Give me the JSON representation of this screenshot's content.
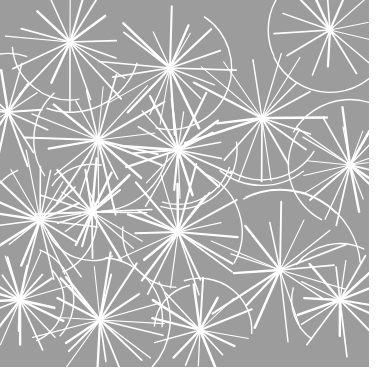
{
  "image": {
    "description": "Gray textile pattern with white hand-drawn starburst / dandelion line motifs",
    "background_color": "#9c9c9c",
    "line_color": "#ffffff",
    "border_color": "#ffffff"
  },
  "bursts": [
    {
      "x": 70,
      "y": 42,
      "r": 70
    },
    {
      "x": 170,
      "y": 68,
      "r": 65
    },
    {
      "x": 8,
      "y": 112,
      "r": 55
    },
    {
      "x": 98,
      "y": 140,
      "r": 70
    },
    {
      "x": 178,
      "y": 150,
      "r": 60
    },
    {
      "x": 262,
      "y": 118,
      "r": 75
    },
    {
      "x": 330,
      "y": 30,
      "r": 60
    },
    {
      "x": 350,
      "y": 165,
      "r": 60
    },
    {
      "x": 40,
      "y": 220,
      "r": 65
    },
    {
      "x": 92,
      "y": 212,
      "r": 55
    },
    {
      "x": 178,
      "y": 232,
      "r": 65
    },
    {
      "x": 280,
      "y": 270,
      "r": 75
    },
    {
      "x": 340,
      "y": 300,
      "r": 55
    },
    {
      "x": 20,
      "y": 300,
      "r": 50
    },
    {
      "x": 100,
      "y": 320,
      "r": 65
    },
    {
      "x": 200,
      "y": 330,
      "r": 55
    }
  ]
}
